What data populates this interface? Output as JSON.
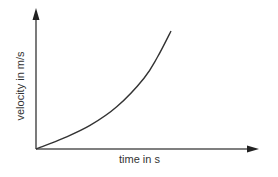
{
  "chart_data": {
    "type": "line",
    "title": "",
    "xlabel": "time in s",
    "ylabel": "velocity in m/s",
    "x_ticks": [],
    "y_ticks": [],
    "grid": false,
    "legend": null,
    "series": [
      {
        "name": "velocity",
        "description": "Accelerating (increasing slope) curve starting at origin",
        "points": [
          {
            "x": 0.0,
            "y": 0.0
          },
          {
            "x": 0.2,
            "y": 0.09
          },
          {
            "x": 0.4,
            "y": 0.2
          },
          {
            "x": 0.6,
            "y": 0.36
          },
          {
            "x": 0.8,
            "y": 0.6
          },
          {
            "x": 0.9,
            "y": 0.78
          },
          {
            "x": 1.0,
            "y": 1.0
          }
        ]
      }
    ],
    "colors": {
      "line": "#333333",
      "axis": "#333333",
      "text": "#333333",
      "background": "#ffffff"
    }
  }
}
